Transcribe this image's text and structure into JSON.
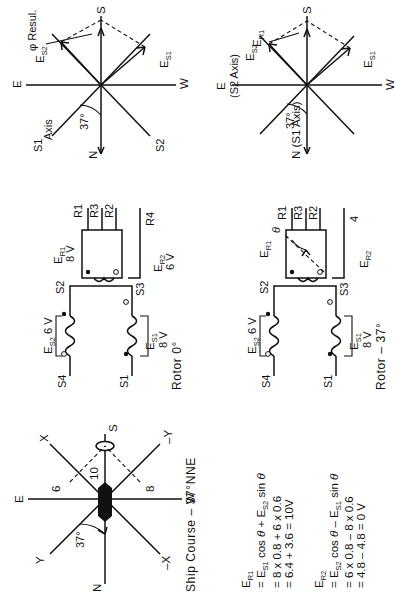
{
  "page": {
    "orientation": "rotated-90-ccw",
    "background": "#ffffff",
    "ink": "#111111"
  },
  "figures": [
    {
      "id": "phasor-rotor0",
      "caption": "",
      "angle_label": "37°",
      "compass": {
        "n": "N",
        "e": "E",
        "s": "S",
        "w": "W"
      },
      "axes": {
        "s1": "S1",
        "s1b": "Axis",
        "s2": "S2"
      },
      "vectors": {
        "es2": "E",
        "es2sub": "S2",
        "es1": "E",
        "es1sub": "S1",
        "result": "φ Resul."
      }
    },
    {
      "id": "phasor-rotor37",
      "caption": "",
      "angle_label": "37°",
      "compass": {
        "n": "N (S1 Axis)",
        "e": "E",
        "e2": "(S2 Axis)",
        "s": "S",
        "w": "W"
      },
      "vectors": {
        "es2": "E",
        "es2sub": "S2",
        "es1": "E",
        "es1sub": "S1",
        "er1": "E",
        "er1sub": "R1"
      }
    },
    {
      "id": "circuit-rotor-0",
      "caption": "Rotor 0°",
      "stator": {
        "s1": "S1",
        "s2": "S2",
        "s3": "S3",
        "s4": "S4",
        "es1": "E",
        "es1sub": "S1",
        "es1_value": "8 V",
        "es2": "E",
        "es2sub": "S2",
        "es2_value": "6 V"
      },
      "rotor": {
        "r1": "R1",
        "r2": "R2",
        "r3": "R3",
        "r4": "R4",
        "er1": "E",
        "er1sub": "R1",
        "er1_value": "8 V",
        "er2": "E",
        "er2sub": "R2",
        "er2_value": "6 V"
      }
    },
    {
      "id": "circuit-rotor-37",
      "caption": "Rotor – 37°",
      "stator": {
        "s1": "S1",
        "s2": "S2",
        "s3": "S3",
        "s4": "S4",
        "es1": "E",
        "es1sub": "S1",
        "es1_value": "8 V",
        "es2": "E",
        "es2sub": "S2",
        "es2_value": "6 V"
      },
      "rotor": {
        "r1": "R1",
        "r2": "R2",
        "r3": "R3",
        "r4": "4",
        "er1": "E",
        "er1sub": "R1",
        "er2": "E",
        "er2sub": "R2",
        "theta": "θ"
      }
    },
    {
      "id": "ship-course",
      "caption": "Ship Course – 37°NNE",
      "angle_label": "37°",
      "compass": {
        "n": "N",
        "e": "E",
        "s": "S",
        "w": "W"
      },
      "axes": {
        "x": "X",
        "y": "Y",
        "nx": "–X",
        "ny": "–Y"
      },
      "values": {
        "y_component": "6",
        "resultant": "10",
        "x_component": "8"
      }
    }
  ],
  "equations": {
    "er1": {
      "lhs": "E",
      "lhs_sub": "R1",
      "lines": [
        "= Eₛ₁ cos θ + Eₛ₂ sin θ",
        "= 8 x 0.8 + 6 x 0.6",
        "= 6.4 + 3.6  = 10 V"
      ],
      "line1_parts": {
        "a": "= E",
        "a_sub": "S1",
        "b": " cos ",
        "b_it": "θ",
        "c": " + E",
        "c_sub": "S2",
        "d": " sin ",
        "d_it": "θ"
      },
      "line2": "= 8 x 0.8 + 6 x 0.6",
      "line3": "= 6.4 + 3.6  = 10V"
    },
    "er2": {
      "lhs": "E",
      "lhs_sub": "R2",
      "line1_parts": {
        "a": "= E",
        "a_sub": "S2",
        "b": " cos ",
        "b_it": "θ",
        "c": " – E",
        "c_sub": "S1",
        "d": " sin ",
        "d_it": "θ"
      },
      "line2": "= 6 x 0.8 – 8 x 0.6",
      "line3": "= 4.8 – 4.8 = 0 V"
    }
  }
}
